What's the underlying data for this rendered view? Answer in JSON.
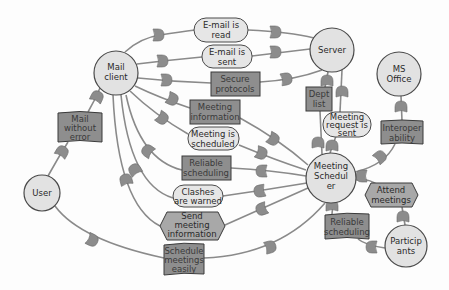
{
  "diagram": {
    "actors": [
      {
        "id": "mail-client",
        "label": [
          "Mail",
          "client"
        ]
      },
      {
        "id": "server",
        "label": [
          "Server"
        ]
      },
      {
        "id": "ms-office",
        "label": [
          "MS",
          "Office"
        ]
      },
      {
        "id": "user",
        "label": [
          "User"
        ]
      },
      {
        "id": "meeting-scheduler",
        "label": [
          "Meeting",
          "Schedul",
          "er"
        ]
      },
      {
        "id": "participants",
        "label": [
          "Particip",
          "ants"
        ]
      }
    ],
    "goals": [
      {
        "id": "email-read",
        "label": [
          "E-mail is",
          "read"
        ]
      },
      {
        "id": "email-sent",
        "label": [
          "E-mail is",
          "sent"
        ]
      },
      {
        "id": "meeting-scheduled",
        "label": [
          "Meeting is",
          "scheduled"
        ]
      },
      {
        "id": "clashes-warned",
        "label": [
          "Clashes",
          "are warned"
        ]
      },
      {
        "id": "meeting-request-sent",
        "label": [
          "Meeting",
          "request is",
          "sent"
        ]
      }
    ],
    "resources": [
      {
        "id": "secure-protocols",
        "label": [
          "Secure",
          "protocols"
        ]
      },
      {
        "id": "meeting-information",
        "label": [
          "Meeting",
          "information"
        ]
      },
      {
        "id": "reliable-scheduling-1",
        "label": [
          "Reliable",
          "scheduling"
        ]
      },
      {
        "id": "schedule-meetings-easily",
        "label": [
          "Schedule",
          "meetings",
          "easily"
        ]
      },
      {
        "id": "mail-without-error",
        "label": [
          "Mail",
          "without",
          "error"
        ]
      },
      {
        "id": "dept-list",
        "label": [
          "Dept",
          "list"
        ]
      },
      {
        "id": "interoperability",
        "label": [
          "Interoper",
          "ability"
        ]
      },
      {
        "id": "reliable-scheduling-2",
        "label": [
          "Reliable",
          "scheduling"
        ]
      }
    ],
    "tasks": [
      {
        "id": "send-meeting-information",
        "label": [
          "Send",
          "meeting",
          "information"
        ]
      },
      {
        "id": "attend-meetings",
        "label": [
          "Attend",
          "meetings"
        ]
      }
    ],
    "dependencies": [
      {
        "from": "mail-client",
        "via": "email-read",
        "to": "server"
      },
      {
        "from": "mail-client",
        "via": "email-sent",
        "to": "server"
      },
      {
        "from": "mail-client",
        "via": "secure-protocols",
        "to": "server"
      },
      {
        "from": "mail-client",
        "via": "meeting-information",
        "to": "meeting-scheduler"
      },
      {
        "from": "mail-client",
        "via": "meeting-scheduled",
        "to": "meeting-scheduler"
      },
      {
        "from": "meeting-scheduler",
        "via": "reliable-scheduling-1",
        "to": "mail-client"
      },
      {
        "from": "meeting-scheduler",
        "via": "clashes-warned",
        "to": "mail-client"
      },
      {
        "from": "meeting-scheduler",
        "via": "send-meeting-information",
        "to": "mail-client"
      },
      {
        "from": "user",
        "via": "mail-without-error",
        "to": "mail-client"
      },
      {
        "from": "user",
        "via": "schedule-meetings-easily",
        "to": "meeting-scheduler"
      },
      {
        "from": "meeting-scheduler",
        "via": "dept-list",
        "to": "server"
      },
      {
        "from": "meeting-scheduler",
        "via": "meeting-request-sent",
        "to": "server"
      },
      {
        "from": "meeting-scheduler",
        "via": "interoperability",
        "to": "ms-office"
      },
      {
        "from": "meeting-scheduler",
        "via": "attend-meetings",
        "to": "participants"
      },
      {
        "from": "participants",
        "via": "reliable-scheduling-2",
        "to": "meeting-scheduler"
      }
    ]
  }
}
